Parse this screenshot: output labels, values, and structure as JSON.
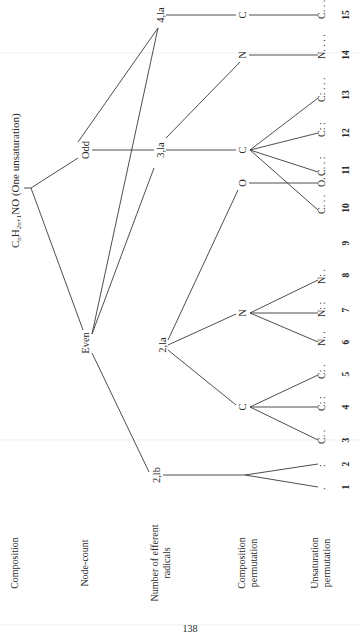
{
  "diagram": {
    "orientation": "rotated-90-ccw",
    "title": {
      "formula_main": "C",
      "sub_n": "n",
      "formula_h": "H",
      "sub_h": "2n+1",
      "formula_rest": "NO (One unsaturation)"
    },
    "row_labels": [
      {
        "id": "composition",
        "lines": [
          "Composition"
        ]
      },
      {
        "id": "node-count",
        "lines": [
          "Node-count"
        ]
      },
      {
        "id": "efferent-radicals",
        "lines": [
          "Number of efferent",
          "radicals"
        ]
      },
      {
        "id": "composition-permutation",
        "lines": [
          "Composition",
          "permutation"
        ]
      },
      {
        "id": "unsaturation-permutation",
        "lines": [
          "Unsaturation",
          "permutation"
        ]
      }
    ],
    "nodes": {
      "odd": "Odd",
      "even": "Even",
      "r_3la": "3,la",
      "r_4la": "4,la",
      "r_2la": "2,la",
      "r_2lb": "2,lb",
      "c_3la": "C",
      "n_3la": "N",
      "c_4la": "C",
      "o_2la": "O",
      "n_2la": "N",
      "c_2la": "C"
    },
    "leaves": [
      {
        "num": "1",
        "label": "."
      },
      {
        "num": "2",
        "label": ":"
      },
      {
        "num": "3",
        "label": "C. ."
      },
      {
        "num": "4",
        "label": "C: :"
      },
      {
        "num": "5",
        "label": "C: ."
      },
      {
        "num": "6",
        "label": "N. ."
      },
      {
        "num": "7",
        "label": "N: :"
      },
      {
        "num": "8",
        "label": "N: ."
      },
      {
        "num": "9",
        "label": "O. ."
      },
      {
        "num": "10",
        "label": "C. . ."
      },
      {
        "num": "11",
        "label": "C. . :"
      },
      {
        "num": "12",
        "label": "C: :"
      },
      {
        "num": "13",
        "label": "C: . . ."
      },
      {
        "num": "14",
        "label": "N. . . ."
      },
      {
        "num": "15",
        "label": "C. . ."
      }
    ],
    "page_number": "138"
  }
}
